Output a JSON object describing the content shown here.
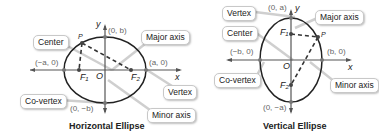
{
  "horizontal": {
    "caption": "Horizontal Ellipse",
    "callouts": {
      "center": "Center",
      "major_axis": "Major axis",
      "vertex": "Vertex",
      "co_vertex": "Co-vertex",
      "minor_axis": "Minor axis"
    },
    "coords": {
      "top": "(0, b)",
      "bottom": "(0, −b)",
      "left": "(−a, 0)",
      "right": "(a, 0)"
    },
    "labels": {
      "x": "x",
      "y": "y",
      "origin": "O",
      "f1": "F₁",
      "f2": "F₂",
      "p": "P"
    }
  },
  "vertical": {
    "caption": "Vertical Ellipse",
    "callouts": {
      "vertex": "Vertex",
      "major_axis": "Major axis",
      "center": "Center",
      "co_vertex": "Co-vertex",
      "minor_axis": "Minor axis"
    },
    "coords": {
      "top": "(0, a)",
      "bottom": "(0, −a)",
      "left": "(−b, 0)",
      "right": "(b, 0)"
    },
    "labels": {
      "x": "x",
      "y": "y",
      "origin": "O",
      "f1": "F₁",
      "f2": "F₂",
      "p": "P"
    }
  },
  "colors": {
    "curve": "#222222",
    "axis": "#555555",
    "callout_line": "#bbbbbb",
    "coord_text": "#666666"
  }
}
